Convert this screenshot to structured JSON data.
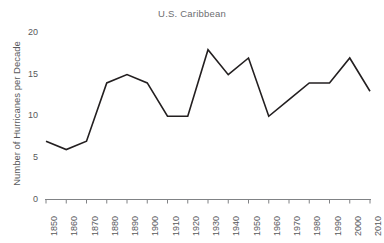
{
  "chart_data": {
    "type": "line",
    "title": "U.S. Caribbean",
    "xlabel": "",
    "ylabel": "Number of Hurricanes per Decade",
    "categories": [
      "1850",
      "1860",
      "1870",
      "1880",
      "1890",
      "1900",
      "1910",
      "1920",
      "1930",
      "1940",
      "1950",
      "1960",
      "1970",
      "1980",
      "1990",
      "2000",
      "2010"
    ],
    "x": [
      1850,
      1860,
      1870,
      1880,
      1890,
      1900,
      1910,
      1920,
      1930,
      1940,
      1950,
      1960,
      1970,
      1980,
      1990,
      2000,
      2010
    ],
    "values": [
      7,
      6,
      7,
      14,
      15,
      14,
      10,
      10,
      18,
      15,
      17,
      10,
      12,
      14,
      14,
      17,
      13
    ],
    "series": [
      {
        "name": "U.S. Caribbean",
        "values": [
          7,
          6,
          7,
          14,
          15,
          14,
          10,
          10,
          18,
          15,
          17,
          10,
          12,
          14,
          14,
          17,
          13
        ]
      }
    ],
    "ylim": [
      0,
      21
    ],
    "yticks": [
      0,
      5,
      10,
      15,
      20
    ],
    "ytick_labels": [
      "0",
      "5",
      "10",
      "15",
      "20"
    ],
    "grid": false,
    "legend": false,
    "legend_position": "none",
    "line_color": "#231f20",
    "axis_color": "#808285",
    "title_color": "#6d6e71",
    "text_color": "#58595b",
    "background_color": "#ffffff"
  }
}
